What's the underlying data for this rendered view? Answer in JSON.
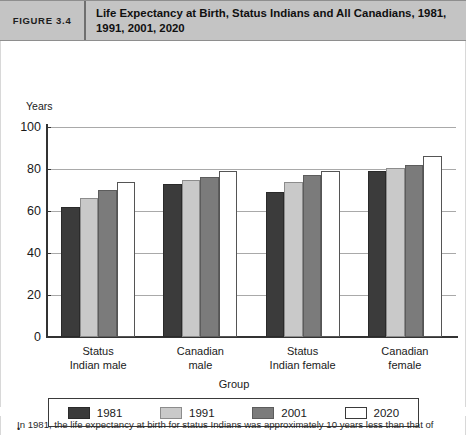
{
  "figure": {
    "number_label": "FIGURE 3.4",
    "title": "Life Expectancy at Birth, Status Indians and All Canadians, 1981, 1991, 2001, 2020"
  },
  "footnote": {
    "bullet_glyph": "•",
    "text": "In 1981, the life expectancy at birth for status Indians was approximately 10 years less than that of"
  },
  "colors": {
    "header_bg": "#c4c4c4",
    "series_1981": "#3b3b3b",
    "series_1991": "#c9c9c9",
    "series_2001": "#7b7b7b",
    "series_2020": "#ffffff",
    "axis": "#333333",
    "gridline": "#a9a9a9"
  },
  "chart_data": {
    "type": "bar",
    "title": "Life Expectancy at Birth, Status Indians and All Canadians, 1981, 1991, 2001, 2020",
    "xlabel": "Group",
    "ylabel": "Years",
    "ylim": [
      0,
      100
    ],
    "yticks": [
      0,
      20,
      40,
      60,
      80,
      100
    ],
    "grid": true,
    "legend_position": "bottom",
    "categories": [
      "Status Indian male",
      "Canadian male",
      "Status Indian female",
      "Canadian female"
    ],
    "category_lines": [
      [
        "Status",
        "Indian male"
      ],
      [
        "Canadian",
        "male"
      ],
      [
        "Status",
        "Indian female"
      ],
      [
        "Canadian",
        "female"
      ]
    ],
    "series": [
      {
        "name": "1981",
        "color": "#3b3b3b",
        "values": [
          62,
          73,
          69,
          79
        ]
      },
      {
        "name": "1991",
        "color": "#c9c9c9",
        "values": [
          66,
          75,
          74,
          80.5
        ]
      },
      {
        "name": "2001",
        "color": "#7b7b7b",
        "values": [
          70,
          76,
          77,
          82
        ]
      },
      {
        "name": "2020",
        "color": "#ffffff",
        "values": [
          74,
          79,
          79,
          86
        ]
      }
    ]
  }
}
